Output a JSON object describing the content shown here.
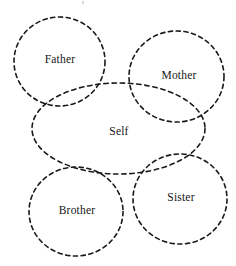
{
  "diagram": {
    "background_color": "#ffffff",
    "stroke_color": "#1a1a1a",
    "stroke_style": "dashed",
    "shapes": [
      {
        "id": "father",
        "label": "Father",
        "shape": "circle",
        "cx": 59.5,
        "cy": 61.5,
        "rx": 45.5,
        "ry": 44.5,
        "rotation": 0,
        "label_x": 60,
        "label_y": 60
      },
      {
        "id": "mother",
        "label": "Mother",
        "shape": "circle",
        "cx": 176.5,
        "cy": 76.5,
        "rx": 47.5,
        "ry": 45.5,
        "rotation": 0,
        "label_x": 179,
        "label_y": 76
      },
      {
        "id": "self",
        "label": "Self",
        "shape": "ellipse",
        "cx": 118.5,
        "cy": 128.5,
        "rx": 86.5,
        "ry": 45.5,
        "rotation": 0,
        "label_x": 119,
        "label_y": 132
      },
      {
        "id": "brother",
        "label": "Brother",
        "shape": "circle",
        "cx": 76,
        "cy": 211.5,
        "rx": 47,
        "ry": 44.5,
        "rotation": 0,
        "label_x": 77,
        "label_y": 211
      },
      {
        "id": "sister",
        "label": "Sister",
        "shape": "circle",
        "cx": 180,
        "cy": 199,
        "rx": 47,
        "ry": 45,
        "rotation": 0,
        "label_x": 181,
        "label_y": 198
      }
    ]
  }
}
